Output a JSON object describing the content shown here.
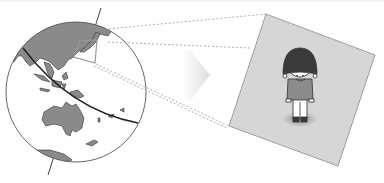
{
  "illustration": {
    "description": "Globe showing Japan region zoomed into a panel with a child bowing",
    "globe": {
      "region_highlighted": "Japan",
      "continents_visible": [
        "Asia",
        "Australia",
        "Antarctica"
      ],
      "fill_color": "#8a8a8a",
      "ocean_color": "#ffffff",
      "outline_color": "#555555"
    },
    "arrow": {
      "direction": "right",
      "color": "#e6e6e6"
    },
    "panel": {
      "background": "#d6d6d6",
      "subject": "child bowing",
      "hair_color": "#3a3a3a",
      "shirt_color": "#8c8c8c",
      "pants_color": "#ffffff",
      "shoes_color": "#3a3a3a"
    },
    "connector_lines": {
      "style": "dashed",
      "color": "#9a9a9a"
    }
  }
}
